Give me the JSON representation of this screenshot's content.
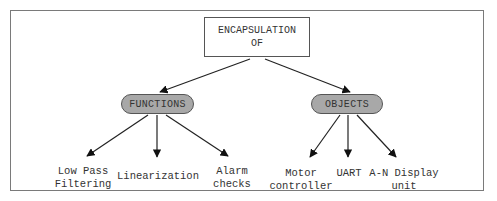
{
  "diagram": {
    "root": {
      "line1": "ENCAPSULATION",
      "line2": "OF"
    },
    "categories": [
      {
        "label": "FUNCTIONS",
        "children": [
          {
            "line1": "Low Pass",
            "line2": "Filtering"
          },
          {
            "line1": "Linearization",
            "line2": ""
          },
          {
            "line1": "Alarm",
            "line2": "checks"
          }
        ]
      },
      {
        "label": "OBJECTS",
        "children": [
          {
            "line1": "Motor",
            "line2": "controller"
          },
          {
            "line1": "UART",
            "line2": ""
          },
          {
            "line1": "A-N Display",
            "line2": "unit"
          }
        ]
      }
    ],
    "colors": {
      "pill_fill": "#a8a8a8",
      "stroke": "#555555",
      "frame": "#7a7a7a",
      "arrow": "#111111"
    }
  }
}
